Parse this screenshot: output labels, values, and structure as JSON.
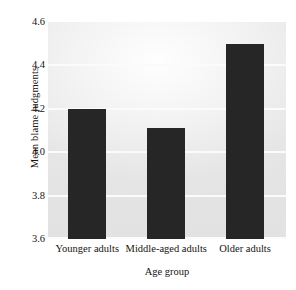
{
  "chart_data": {
    "type": "bar",
    "title": "",
    "xlabel": "Age group",
    "ylabel": "Mean blame judgments",
    "categories": [
      "Younger adults",
      "Middle-aged adults",
      "Older adults"
    ],
    "values": [
      4.2,
      4.11,
      4.5
    ],
    "ylim": [
      3.6,
      4.6
    ],
    "yticks": [
      "4.6",
      "4.4",
      "4.2",
      "4.0",
      "3.8",
      "3.6"
    ],
    "ytick_values": [
      4.6,
      4.4,
      4.2,
      4.0,
      3.8,
      3.6
    ],
    "grid": true,
    "legend": "none",
    "bar_color": "#262626",
    "plot_background_color": "#e5e5e5",
    "gridline_color": "#fbfbfb"
  }
}
